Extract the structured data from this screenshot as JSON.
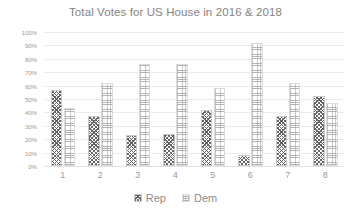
{
  "chart_data": {
    "type": "bar",
    "title": "Total Votes for US House in 2016 & 2018",
    "xlabel": "",
    "ylabel": "",
    "categories": [
      "1",
      "2",
      "3",
      "4",
      "5",
      "6",
      "7",
      "8"
    ],
    "series": [
      {
        "name": "Rep",
        "values": [
          57,
          37,
          23,
          24,
          42,
          8,
          37,
          52
        ]
      },
      {
        "name": "Dem",
        "values": [
          43,
          62,
          76,
          76,
          58,
          92,
          62,
          47
        ]
      }
    ],
    "ylim": [
      0,
      100
    ],
    "y_tick_labels": [
      "100%",
      "90%",
      "80%",
      "70%",
      "60%",
      "50%",
      "40%",
      "30%",
      "20%",
      "10%",
      "0%"
    ],
    "y_tick_values": [
      100,
      90,
      80,
      70,
      60,
      50,
      40,
      30,
      20,
      10,
      0
    ],
    "grid": true,
    "legend_position": "bottom",
    "colors": {
      "rep": "#5a5a5a",
      "dem": "#a8a8a8",
      "grid": "#ececed",
      "text": "#9a9a9a",
      "title": "#848484",
      "background": "#ffffff"
    }
  }
}
